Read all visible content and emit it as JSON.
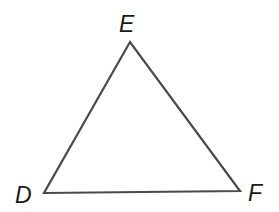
{
  "diagram": {
    "type": "triangle",
    "stroke_color": "#4a4a4a",
    "vertices": [
      {
        "label": "E",
        "x": 130,
        "y": 42
      },
      {
        "label": "D",
        "x": 44,
        "y": 193
      },
      {
        "label": "F",
        "x": 240,
        "y": 191
      }
    ],
    "labels": {
      "E": "E",
      "D": "D",
      "F": "F"
    }
  }
}
